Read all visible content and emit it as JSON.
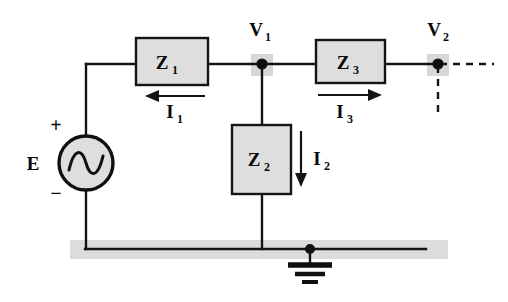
{
  "diagram": {
    "colors": {
      "wire": "#141414",
      "box_fill": "#dedede",
      "box_stroke": "#141414",
      "node": "#101010",
      "highlight": "#d8d8d8",
      "ground_shadow": "#dcdcdc",
      "background": "#ffffff"
    },
    "source": {
      "label": "E",
      "plus_sign": "+",
      "minus_sign": "−",
      "symbol": "ac-sine-source"
    },
    "impedances": [
      {
        "id": "z1",
        "label": "Z",
        "subscript": "1",
        "orientation": "horizontal"
      },
      {
        "id": "z2",
        "label": "Z",
        "subscript": "2",
        "orientation": "vertical"
      },
      {
        "id": "z3",
        "label": "Z",
        "subscript": "3",
        "orientation": "horizontal"
      }
    ],
    "currents": [
      {
        "id": "i1",
        "label": "I",
        "subscript": "1",
        "direction": "left"
      },
      {
        "id": "i2",
        "label": "I",
        "subscript": "2",
        "direction": "down"
      },
      {
        "id": "i3",
        "label": "I",
        "subscript": "3",
        "direction": "right"
      }
    ],
    "nodes": [
      {
        "id": "v1",
        "label": "V",
        "subscript": "1"
      },
      {
        "id": "v2",
        "label": "V",
        "subscript": "2"
      }
    ],
    "ground": {
      "symbol": "ground-icon",
      "bars": 3
    }
  }
}
